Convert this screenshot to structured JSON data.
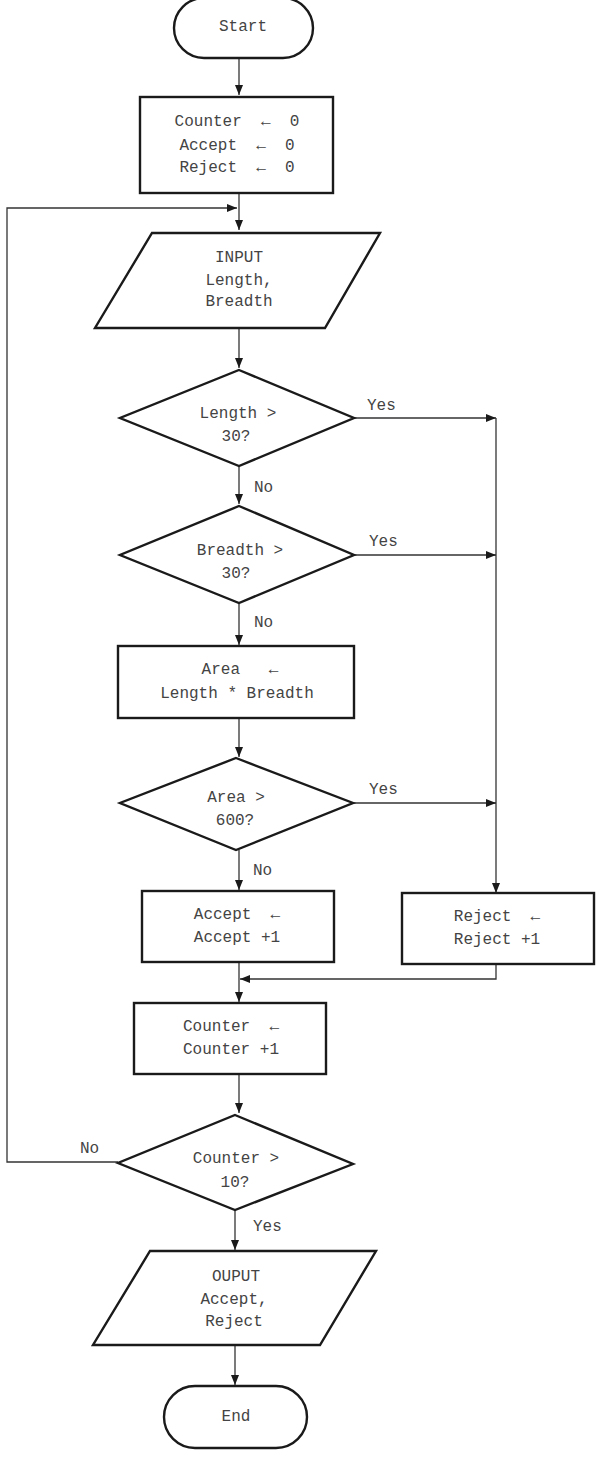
{
  "flowchart": {
    "start": "Start",
    "init": [
      "Counter  ←  0",
      "Accept  ←  0",
      "Reject  ←  0"
    ],
    "input": [
      "INPUT",
      "Length,",
      "Breadth"
    ],
    "decision_length": [
      "Length >",
      "30?"
    ],
    "decision_breadth": [
      "Breadth >",
      "30?"
    ],
    "area_calc": [
      "Area   ←",
      "Length * Breadth"
    ],
    "decision_area": [
      "Area >",
      "600?"
    ],
    "accept_inc": [
      "Accept  ←",
      "Accept +1"
    ],
    "reject_inc": [
      "Reject  ←",
      "Reject +1"
    ],
    "counter_inc": [
      "Counter  ←",
      "Counter +1"
    ],
    "decision_counter": [
      "Counter >",
      "10?"
    ],
    "output": [
      "OUPUT",
      "Accept,",
      "Reject"
    ],
    "end": "End",
    "labels": {
      "yes": "Yes",
      "no": "No"
    }
  }
}
